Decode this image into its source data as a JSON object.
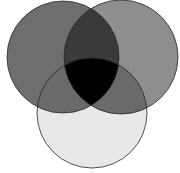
{
  "diagram": {
    "type": "venn",
    "set_count": 3,
    "circles": [
      {
        "id": "left",
        "cx": 63,
        "cy": 57,
        "r": 56,
        "fill": "#777777",
        "opacity": 0.85
      },
      {
        "id": "right",
        "cx": 121,
        "cy": 57,
        "r": 57,
        "fill": "#8a8a8a",
        "opacity": 0.8
      },
      {
        "id": "bottom",
        "cx": 92,
        "cy": 113,
        "r": 55,
        "fill": "#e6e6e6",
        "opacity": 1
      }
    ],
    "colors": {
      "left_only": "#6e6e6e",
      "right_only": "#8e8e8e",
      "bottom_only": "#e8e8e8",
      "left_right": "#3a3a3a",
      "left_bottom": "#6a6a6a",
      "right_bottom": "#6a6a6a",
      "all_three": "#000000",
      "stroke": "#2a2a2a",
      "background": "#ffffff"
    }
  }
}
